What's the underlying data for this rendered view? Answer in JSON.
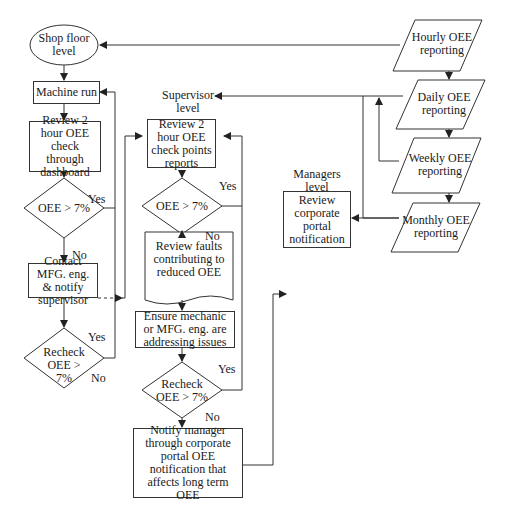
{
  "levels": {
    "shop_floor": "Shop floor level",
    "supervisor": "Supervisor level",
    "managers": "Managers level"
  },
  "shop": {
    "machine_run": "Machine run",
    "review": "Review 2 hour OEE check through dashboard",
    "decision": "OEE > 7%",
    "contact": "Contact MFG. eng. & notify supervisor",
    "recheck": "Recheck OEE > 7%"
  },
  "supervisor": {
    "review": "Review 2 hour OEE check points reports",
    "decision": "OEE > 7%",
    "faults": "Review faults contributing to reduced OEE",
    "ensure": "Ensure mechanic or MFG. eng. are addressing issues",
    "recheck": "Recheck OEE > 7%",
    "notify": "Notify manager through corporate portal OEE notification that affects long term OEE"
  },
  "managers": {
    "review": "Review corporate portal notification"
  },
  "reporting": {
    "hourly": "Hourly OEE reporting",
    "daily": "Daily OEE reporting",
    "weekly": "Weekly OEE reporting",
    "monthly": "Monthly OEE reporting"
  },
  "labels": {
    "yes": "Yes",
    "no": "No"
  }
}
